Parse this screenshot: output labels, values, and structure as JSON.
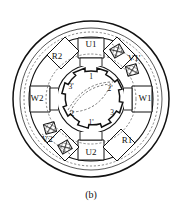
{
  "figure": {
    "caption": "(b)",
    "geometry": {
      "center_x": 91,
      "center_y": 99,
      "outer_radius": 78,
      "housing_inner_radius": 72,
      "dashed_outer_radius": 68,
      "stator_outer_radius": 62,
      "stator_yoke_radius": 50,
      "dashed_inner_radius": 45,
      "stator_tooth_inner_radius": 34,
      "rotor_outer_radius": 31,
      "rotor_tooth_root_radius": 23,
      "rotor_bore_radius": 13
    },
    "colors": {
      "line": "#111111",
      "dashed": "#555555",
      "magnet_fill": "#ffffff",
      "background": "#ffffff"
    },
    "stator": {
      "slot_count": 8,
      "labels": [
        {
          "text": "U1",
          "angle_deg": -90,
          "radius": 56
        },
        {
          "text": "V1'",
          "angle_deg": -45,
          "radius": 56
        },
        {
          "text": "W1",
          "angle_deg": 0,
          "radius": 56
        },
        {
          "text": "R1",
          "angle_deg": 45,
          "radius": 56
        },
        {
          "text": "U2",
          "angle_deg": 90,
          "radius": 56
        },
        {
          "text": "V2'",
          "angle_deg": 135,
          "radius": 56
        },
        {
          "text": "W2",
          "angle_deg": 180,
          "radius": 56
        },
        {
          "text": "R2",
          "angle_deg": -135,
          "radius": 56
        }
      ]
    },
    "magnets": {
      "count": 4,
      "hatch": "cross-hatch",
      "positions": [
        {
          "angle_deg": -62,
          "radius": 56
        },
        {
          "angle_deg": -28,
          "radius": 56
        },
        {
          "angle_deg": 118,
          "radius": 56
        },
        {
          "angle_deg": 152,
          "radius": 56
        }
      ]
    },
    "rotor": {
      "tooth_count": 8,
      "labels": [
        {
          "text": "1",
          "angle_deg": -90,
          "radius": 26
        },
        {
          "text": "2'",
          "angle_deg": -35,
          "radius": 26
        },
        {
          "text": "3",
          "angle_deg": 25,
          "radius": 26
        },
        {
          "text": "1'",
          "angle_deg": 85,
          "radius": 26
        },
        {
          "text": "2",
          "angle_deg": 140,
          "radius": 26
        },
        {
          "text": "3'",
          "angle_deg": -150,
          "radius": 26
        }
      ],
      "flux_path": "dashed-lens"
    }
  }
}
